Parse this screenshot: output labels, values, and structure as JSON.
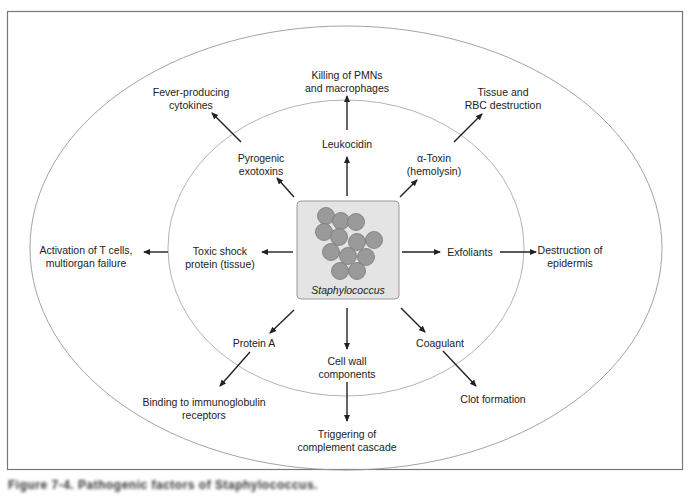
{
  "figure": {
    "caption": "Figure 7-4. Pathogenic factors of Staphylococcus.",
    "center": {
      "label": "Staphylococcus",
      "icon": "staphylococcus-cluster-icon",
      "box_color": "#e4e4e4",
      "cell_color": "#9a9a9a"
    },
    "inner_factors": [
      {
        "id": "pyrogenic",
        "label": "Pyrogenic\nexotoxins"
      },
      {
        "id": "leukocidin",
        "label": "Leukocidin"
      },
      {
        "id": "alpha-toxin",
        "label": "α-Toxin\n(hemolysin)"
      },
      {
        "id": "toxic-shock",
        "label": "Toxic shock\nprotein (tissue)"
      },
      {
        "id": "exfoliants",
        "label": "Exfoliants"
      },
      {
        "id": "protein-a",
        "label": "Protein A"
      },
      {
        "id": "cell-wall",
        "label": "Cell wall\ncomponents"
      },
      {
        "id": "coagulant",
        "label": "Coagulant"
      }
    ],
    "outer_effects": [
      {
        "id": "fever",
        "label": "Fever-producing\ncytokines"
      },
      {
        "id": "killing",
        "label": "Killing of PMNs\nand macrophages"
      },
      {
        "id": "tissue-rbc",
        "label": "Tissue and\nRBC destruction"
      },
      {
        "id": "t-cells",
        "label": "Activation of T cells,\nmultiorgan failure"
      },
      {
        "id": "epidermis",
        "label": "Destruction of\nepidermis"
      },
      {
        "id": "binding",
        "label": "Binding to immunoglobulin\nreceptors"
      },
      {
        "id": "complement",
        "label": "Triggering of\ncomplement cascade"
      },
      {
        "id": "clot",
        "label": "Clot formation"
      }
    ]
  }
}
